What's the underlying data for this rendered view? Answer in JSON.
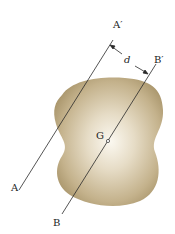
{
  "diagram": {
    "type": "parallel-axis-theorem",
    "labels": {
      "a_prime": "A′",
      "a": "A",
      "b_prime": "B′",
      "b": "B",
      "d": "d",
      "g": "G"
    },
    "colors": {
      "body_edge": "#a8956a",
      "body_center": "#f8f4ea",
      "line": "#2a2a2a",
      "background": "#ffffff"
    }
  }
}
